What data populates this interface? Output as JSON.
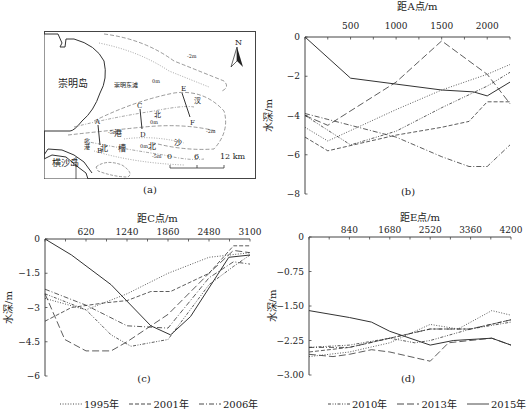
{
  "panel_a": {
    "caption": "(a)",
    "labels": {
      "chongming": "崇明岛",
      "chongming_east": "崇明东滩",
      "hengsha": "横沙岛",
      "north_arrow": "N",
      "scale": [
        "0",
        "6",
        "12 km"
      ],
      "points": [
        "A",
        "B",
        "C",
        "D",
        "E",
        "F"
      ],
      "channel_chars": [
        "北",
        "港",
        "北",
        "沙",
        "汊",
        "北",
        "槽",
        "北",
        "港"
      ],
      "contours": [
        "-2m",
        "0m",
        "-5m",
        "0m",
        "0m",
        "-2m",
        "-5m"
      ]
    }
  },
  "chart_data": [
    {
      "id": "b",
      "type": "line",
      "caption": "(b)",
      "title": "",
      "xlabel": "距A点/m",
      "ylabel": "水深/m",
      "xticks": [
        500,
        1000,
        1500,
        2000
      ],
      "yticks": [
        0,
        -2,
        -4,
        -6,
        -8
      ],
      "xlim": [
        0,
        2250
      ],
      "ylim": [
        -8,
        0
      ],
      "series": [
        {
          "name": "1995年",
          "style": "dotted",
          "points": [
            [
              0,
              -4.6
            ],
            [
              250,
              -5.3
            ],
            [
              1000,
              -3.7
            ],
            [
              1500,
              -2.7
            ],
            [
              2000,
              -1.9
            ],
            [
              2250,
              -1.4
            ]
          ]
        },
        {
          "name": "2001年",
          "style": "dashed",
          "points": [
            [
              0,
              -5.1
            ],
            [
              250,
              -5.8
            ],
            [
              1000,
              -5.0
            ],
            [
              1500,
              -4.6
            ],
            [
              1800,
              -4.3
            ],
            [
              2000,
              -3.3
            ],
            [
              2250,
              -3.3
            ]
          ]
        },
        {
          "name": "2006年",
          "style": "dashdot",
          "points": [
            [
              0,
              -3.9
            ],
            [
              250,
              -4.2
            ],
            [
              1000,
              -5.1
            ],
            [
              1500,
              -6.1
            ],
            [
              1800,
              -6.6
            ],
            [
              2000,
              -6.6
            ],
            [
              2250,
              -5.5
            ]
          ]
        },
        {
          "name": "2010年",
          "style": "dashdotdot",
          "points": [
            [
              0,
              -4.0
            ],
            [
              500,
              -5.5
            ],
            [
              1000,
              -4.8
            ],
            [
              1500,
              -3.6
            ],
            [
              2000,
              -2.5
            ],
            [
              2250,
              -1.8
            ]
          ]
        },
        {
          "name": "2013年",
          "style": "longdash",
          "points": [
            [
              0,
              -4.0
            ],
            [
              250,
              -4.5
            ],
            [
              1000,
              -2.3
            ],
            [
              1500,
              -0.2
            ],
            [
              2000,
              -1.9
            ],
            [
              2250,
              -3.4
            ]
          ]
        },
        {
          "name": "2015年",
          "style": "solid",
          "points": [
            [
              0,
              0
            ],
            [
              500,
              -2.1
            ],
            [
              1000,
              -2.4
            ],
            [
              1500,
              -2.7
            ],
            [
              1850,
              -2.8
            ],
            [
              2000,
              -3.0
            ],
            [
              2250,
              -2.3
            ]
          ]
        }
      ]
    },
    {
      "id": "c",
      "type": "line",
      "caption": "(c)",
      "title": "",
      "xlabel": "距C点/m",
      "ylabel": "水深/m",
      "xticks": [
        620,
        1240,
        1860,
        2480,
        3100
      ],
      "yticks": [
        0,
        -1.5,
        -3,
        -4.5,
        -6
      ],
      "xlim": [
        0,
        3100
      ],
      "ylim": [
        -6,
        0
      ],
      "series": [
        {
          "name": "1995年",
          "style": "dotted",
          "points": [
            [
              0,
              -2.6
            ],
            [
              620,
              -3.1
            ],
            [
              1240,
              -2.4
            ],
            [
              1860,
              -1.5
            ],
            [
              2480,
              -0.8
            ],
            [
              3100,
              -0.6
            ]
          ]
        },
        {
          "name": "2001年",
          "style": "dashed",
          "points": [
            [
              0,
              -3.6
            ],
            [
              400,
              -3.0
            ],
            [
              900,
              -2.8
            ],
            [
              1240,
              -2.7
            ],
            [
              1600,
              -2.3
            ],
            [
              1900,
              -2.3
            ],
            [
              2480,
              -1.5
            ],
            [
              2850,
              -0.3
            ],
            [
              3100,
              -0.3
            ]
          ]
        },
        {
          "name": "2006年",
          "style": "dashdot",
          "points": [
            [
              0,
              -2.2
            ],
            [
              620,
              -2.9
            ],
            [
              1240,
              -3.8
            ],
            [
              1860,
              -3.9
            ],
            [
              2480,
              -1.7
            ],
            [
              2850,
              -1.0
            ],
            [
              3100,
              -1.1
            ]
          ]
        },
        {
          "name": "2010年",
          "style": "dashdotdot",
          "points": [
            [
              0,
              -2.4
            ],
            [
              620,
              -3.1
            ],
            [
              1000,
              -4.2
            ],
            [
              1300,
              -4.7
            ],
            [
              1860,
              -4.4
            ],
            [
              2480,
              -2.0
            ],
            [
              2850,
              -1.2
            ],
            [
              3100,
              -0.7
            ]
          ]
        },
        {
          "name": "2013年",
          "style": "longdash",
          "points": [
            [
              0,
              -2.4
            ],
            [
              300,
              -4.4
            ],
            [
              620,
              -4.9
            ],
            [
              1000,
              -4.9
            ],
            [
              1240,
              -4.5
            ],
            [
              1860,
              -3.3
            ],
            [
              2480,
              -1.5
            ],
            [
              2850,
              -0.5
            ],
            [
              3100,
              -0.6
            ]
          ]
        },
        {
          "name": "2015年",
          "style": "solid",
          "points": [
            [
              0,
              0
            ],
            [
              400,
              -0.7
            ],
            [
              1000,
              -2.0
            ],
            [
              1600,
              -3.8
            ],
            [
              1900,
              -4.2
            ],
            [
              2200,
              -3.4
            ],
            [
              2780,
              -0.8
            ],
            [
              3100,
              -0.7
            ]
          ]
        }
      ]
    },
    {
      "id": "d",
      "type": "line",
      "caption": "(d)",
      "title": "",
      "xlabel": "距E点/m",
      "ylabel": "水深/m",
      "xticks": [
        840,
        1680,
        2520,
        3360,
        4200
      ],
      "ytick_labels": [
        "0",
        "-0.75",
        "-1.50",
        "-2.25",
        "-3.00"
      ],
      "yticks": [
        0,
        -0.75,
        -1.5,
        -2.25,
        -3.0
      ],
      "xlim": [
        0,
        4200
      ],
      "ylim": [
        -3,
        0
      ],
      "series": [
        {
          "name": "1995年",
          "style": "dotted",
          "points": [
            [
              0,
              -2.6
            ],
            [
              840,
              -2.5
            ],
            [
              1680,
              -2.3
            ],
            [
              2520,
              -1.9
            ],
            [
              3100,
              -2.0
            ],
            [
              3800,
              -1.6
            ],
            [
              4200,
              -1.7
            ]
          ]
        },
        {
          "name": "2001年",
          "style": "dashed",
          "points": [
            [
              0,
              -2.5
            ],
            [
              840,
              -2.4
            ],
            [
              1680,
              -2.2
            ],
            [
              2520,
              -2.0
            ],
            [
              3360,
              -2.0
            ],
            [
              4200,
              -1.8
            ]
          ]
        },
        {
          "name": "2006年",
          "style": "dashdot",
          "points": [
            [
              0,
              -2.4
            ],
            [
              840,
              -2.4
            ],
            [
              1680,
              -2.2
            ],
            [
              2520,
              -2.0
            ],
            [
              3360,
              -2.0
            ],
            [
              4200,
              -1.8
            ]
          ]
        },
        {
          "name": "2010年",
          "style": "dashdotdot",
          "points": [
            [
              0,
              -2.4
            ],
            [
              840,
              -2.35
            ],
            [
              1680,
              -2.2
            ],
            [
              2200,
              -2.3
            ],
            [
              2520,
              -2.25
            ],
            [
              3360,
              -2.0
            ],
            [
              4200,
              -1.85
            ]
          ]
        },
        {
          "name": "2013年",
          "style": "longdash",
          "points": [
            [
              0,
              -2.55
            ],
            [
              500,
              -2.6
            ],
            [
              840,
              -2.55
            ],
            [
              1300,
              -2.45
            ],
            [
              1680,
              -2.5
            ],
            [
              2100,
              -2.6
            ],
            [
              2520,
              -2.7
            ],
            [
              2900,
              -2.3
            ],
            [
              3800,
              -2.2
            ],
            [
              4200,
              -2.35
            ]
          ]
        },
        {
          "name": "2015年",
          "style": "solid",
          "points": [
            [
              0,
              -1.6
            ],
            [
              840,
              -1.75
            ],
            [
              1300,
              -1.85
            ],
            [
              1680,
              -2.05
            ],
            [
              2520,
              -2.35
            ],
            [
              3000,
              -2.25
            ],
            [
              3800,
              -2.2
            ],
            [
              4200,
              -2.35
            ]
          ]
        }
      ]
    }
  ],
  "legend_left": [
    {
      "label": "1995年",
      "style": "dotted"
    },
    {
      "label": "2001年",
      "style": "dashed"
    },
    {
      "label": "2006年",
      "style": "dashdot"
    }
  ],
  "legend_right": [
    {
      "label": "2010年",
      "style": "dashdotdot"
    },
    {
      "label": "2013年",
      "style": "longdash"
    },
    {
      "label": "2015年",
      "style": "solid"
    }
  ],
  "colors": {
    "line": "#333333",
    "axis": "#444444",
    "text": "#222222"
  }
}
